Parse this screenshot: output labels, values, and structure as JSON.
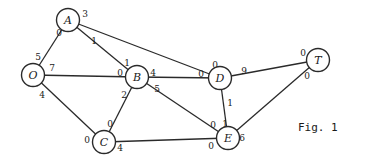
{
  "figure": {
    "caption": "Fig. 1",
    "nodes": [
      {
        "id": "A",
        "label": "A",
        "x": 68,
        "y": 20
      },
      {
        "id": "O",
        "label": "O",
        "x": 33,
        "y": 75
      },
      {
        "id": "B",
        "label": "B",
        "x": 137,
        "y": 77
      },
      {
        "id": "C",
        "label": "C",
        "x": 104,
        "y": 142
      },
      {
        "id": "D",
        "label": "D",
        "x": 220,
        "y": 78
      },
      {
        "id": "E",
        "label": "E",
        "x": 228,
        "y": 138
      },
      {
        "id": "T",
        "label": "T",
        "x": 318,
        "y": 60
      }
    ],
    "edges": [
      {
        "from": "O",
        "to": "A",
        "from_label": "5",
        "to_label": "0"
      },
      {
        "from": "A",
        "to": "B",
        "from_label": "1",
        "to_label": "1"
      },
      {
        "from": "A",
        "to": "D",
        "from_label": "3",
        "to_label": "0"
      },
      {
        "from": "O",
        "to": "B",
        "from_label": "7",
        "to_label": "0"
      },
      {
        "from": "O",
        "to": "C",
        "from_label": "4",
        "to_label": "0"
      },
      {
        "from": "B",
        "to": "C",
        "from_label": "2",
        "to_label": "0"
      },
      {
        "from": "B",
        "to": "D",
        "from_label": "4",
        "to_label": "0"
      },
      {
        "from": "B",
        "to": "E",
        "from_label": "5",
        "to_label": "0"
      },
      {
        "from": "C",
        "to": "E",
        "from_label": "4",
        "to_label": "0"
      },
      {
        "from": "D",
        "to": "T",
        "from_label": "9",
        "to_label": "0"
      },
      {
        "from": "D",
        "to": "E",
        "from_label": "1",
        "to_label": "1"
      },
      {
        "from": "E",
        "to": "T",
        "from_label": "6",
        "to_label": "0"
      }
    ],
    "weight_labels": [
      {
        "text": "0",
        "x": 59,
        "y": 33
      },
      {
        "text": "3",
        "x": 85,
        "y": 14
      },
      {
        "text": "1",
        "x": 94,
        "y": 41
      },
      {
        "text": "5",
        "x": 38,
        "y": 57
      },
      {
        "text": "7",
        "x": 52,
        "y": 68
      },
      {
        "text": "4",
        "x": 42,
        "y": 95
      },
      {
        "text": "1",
        "x": 127,
        "y": 63
      },
      {
        "text": "0",
        "x": 120,
        "y": 73
      },
      {
        "text": "4",
        "x": 153,
        "y": 73
      },
      {
        "text": "2",
        "x": 124,
        "y": 95
      },
      {
        "text": "5",
        "x": 157,
        "y": 89
      },
      {
        "text": "0",
        "x": 110,
        "y": 124
      },
      {
        "text": "0",
        "x": 87,
        "y": 140
      },
      {
        "text": "4",
        "x": 120,
        "y": 148
      },
      {
        "text": "0",
        "x": 215,
        "y": 65
      },
      {
        "text": "0",
        "x": 201,
        "y": 74
      },
      {
        "text": "9",
        "x": 244,
        "y": 71
      },
      {
        "text": "1",
        "x": 230,
        "y": 103
      },
      {
        "text": "0",
        "x": 213,
        "y": 125
      },
      {
        "text": "1",
        "x": 225,
        "y": 124
      },
      {
        "text": "0",
        "x": 211,
        "y": 146
      },
      {
        "text": "6",
        "x": 242,
        "y": 138
      },
      {
        "text": "0",
        "x": 303,
        "y": 53
      },
      {
        "text": "0",
        "x": 307,
        "y": 76
      }
    ]
  }
}
